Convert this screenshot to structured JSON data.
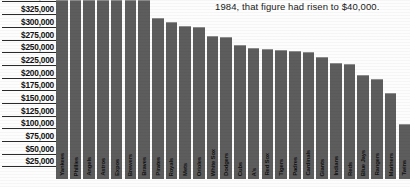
{
  "caption": {
    "text": "1984, that figure had risen to $40,000."
  },
  "chart_data": {
    "type": "bar",
    "title": "",
    "xlabel": "",
    "ylabel": "",
    "ylim": [
      0,
      362500
    ],
    "grid": true,
    "legend": "none",
    "ytick_labels": [
      "$350,000",
      "$325,000",
      "$300,000",
      "$275,000",
      "$250,000",
      "$225,000",
      "$200,000",
      "$175,000",
      "$150,000",
      "$125,000",
      "$100,000",
      "$75,000",
      "$50,000",
      "$25,000"
    ],
    "ytick_values": [
      350000,
      325000,
      300000,
      275000,
      250000,
      225000,
      200000,
      175000,
      150000,
      125000,
      100000,
      75000,
      50000,
      25000
    ],
    "categories": [
      "Yankees",
      "Phillies",
      "Angels",
      "Astros",
      "Expos",
      "Brewers",
      "Braves",
      "Pirates",
      "Royals",
      "Mets",
      "Orioles",
      "White Sox",
      "Dodgers",
      "Cubs",
      "A's",
      "Red Sox",
      "Tigers",
      "Padres",
      "Cardinals",
      "Giants",
      "Indians",
      "Reds",
      "Blue Jays",
      "Rangers",
      "Mariners",
      "Twins"
    ],
    "values": [
      458000,
      440000,
      432000,
      390000,
      372000,
      370000,
      362000,
      318000,
      310000,
      302000,
      300000,
      282000,
      280000,
      265000,
      258000,
      256000,
      254000,
      252000,
      250000,
      240000,
      228000,
      226000,
      205000,
      198000,
      170000,
      108000
    ],
    "bar_color": "#5d5d5d",
    "bars_clipped_at_top": [
      "Yankees",
      "Phillies",
      "Angels"
    ]
  }
}
